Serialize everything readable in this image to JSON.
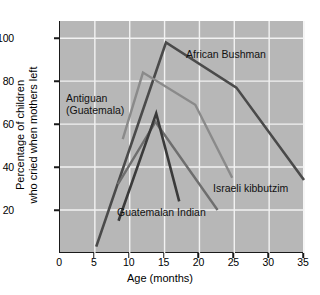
{
  "chart_data": {
    "type": "line",
    "title": "",
    "xlabel": "Age (months)",
    "ylabel": "Percentage of children\nwho cried when mothers left",
    "ylabel_line1": "Percentage of children",
    "ylabel_line2": "who cried when mothers left",
    "xlim": [
      0,
      35
    ],
    "ylim": [
      0,
      108
    ],
    "xticks": [
      0,
      5,
      10,
      15,
      20,
      25,
      30,
      35
    ],
    "xtick_labels": [
      "0",
      "5",
      "10",
      "15",
      "20",
      "25",
      "30",
      "35"
    ],
    "yticks": [
      20,
      40,
      60,
      80,
      100
    ],
    "ytick_labels": [
      "20",
      "40",
      "60",
      "80",
      "100"
    ],
    "grid": true,
    "grid_color": "#f2f2f2",
    "plot_background": "#b7b7b7",
    "legend_position": "inline-annotations",
    "series": [
      {
        "name": "African Bushman",
        "color": "#4a4a4a",
        "width": 2.6,
        "label_x": 20.0,
        "label_y": 90,
        "points": [
          [
            5.2,
            3
          ],
          [
            15.2,
            98
          ],
          [
            25.3,
            77
          ],
          [
            35.0,
            34
          ]
        ]
      },
      {
        "name": "Antiguan (Guatemala)",
        "color": "#8a8a8a",
        "width": 2.4,
        "label_x": 1.5,
        "label_y": 72,
        "points": [
          [
            9.0,
            53
          ],
          [
            11.9,
            84
          ],
          [
            19.4,
            69
          ],
          [
            24.7,
            35
          ]
        ]
      },
      {
        "name": "Israeli kibbutzim",
        "color": "#6e6e6e",
        "width": 2.4,
        "label_x": 23.0,
        "label_y": 25,
        "points": [
          [
            8.3,
            32
          ],
          [
            13.7,
            61
          ],
          [
            22.6,
            20
          ]
        ]
      },
      {
        "name": "Guatemalan Indian",
        "color": "#3a3a3a",
        "width": 2.6,
        "label_x": 9.5,
        "label_y": 16,
        "points": [
          [
            8.4,
            15
          ],
          [
            13.8,
            65
          ],
          [
            17.1,
            24
          ]
        ]
      }
    ]
  },
  "axes": {
    "x_title": "Age (months)",
    "y_title_line1": "Percentage of children",
    "y_title_line2": "who cried when mothers left"
  },
  "annotations": {
    "african": "African Bushman",
    "antiguan_line1": "Antiguan",
    "antiguan_line2": "(Guatemala)",
    "israeli": "Israeli kibbutzim",
    "guatemalan": "Guatemalan Indian"
  }
}
